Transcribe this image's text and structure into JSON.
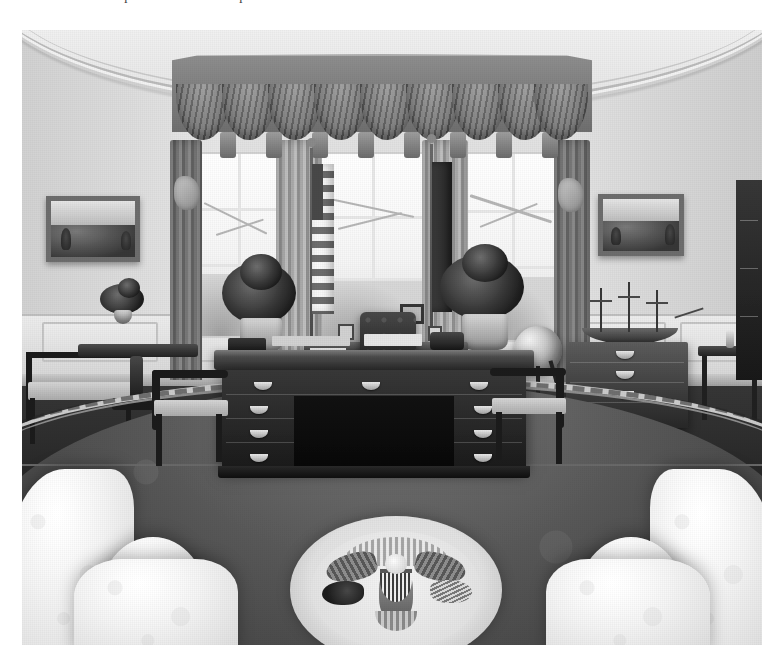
{
  "page": {
    "background_color": "#ffffff",
    "text_remnants": [
      "l",
      "l"
    ]
  },
  "photograph": {
    "title": "The Oval Office",
    "description": "Black and white photograph of the White House Oval Office",
    "style": "black-and-white halftone print",
    "frame": {
      "x": 22,
      "y": 30,
      "width": 740,
      "height": 615
    },
    "colors": {
      "wall": "#d8d8d8",
      "ceiling_cornice": "#efefef",
      "drapery": "#8f8f8f",
      "carpet": "#4f4f4f",
      "carpet_border": "#c8c8c8",
      "furniture_dark": "#2a2a2a",
      "sofa": "#f2f2f2",
      "seal": "#e0e0e0"
    },
    "elements": {
      "ceiling": "curved-cornice-molding",
      "back_wall": "oval-curved-wall",
      "wainscot": "paneled-chair-rail-wainscot",
      "window_bay": {
        "label": "three-window-bay",
        "window_count": 3,
        "valance": "swagged-pelmet-valance",
        "swag_count": 9,
        "drapery_panels": 4
      },
      "flags": [
        {
          "name": "american-flag",
          "position": "left-of-desk"
        },
        {
          "name": "presidential-flag",
          "position": "right-of-desk"
        }
      ],
      "desk": {
        "label": "resolute-desk",
        "drawer_pulls": 11,
        "items": [
          "papers",
          "telephone",
          "desk-accessories",
          "pen-set"
        ]
      },
      "desk_chair": "tufted-leather-executive-chair",
      "visitor_chairs": 2,
      "credenza": "window-credenza-with-photo-frames",
      "globe": "floor-standing-globe",
      "paintings": [
        {
          "name": "painting-left-wall",
          "subject": "landscape"
        },
        {
          "name": "painting-right-wall",
          "subject": "landscape"
        }
      ],
      "ship_model": "model-sailing-ship-on-chest",
      "chest_of_drawers": "mahogany-chest-of-drawers",
      "console_table_left": "console-table-with-flower-arrangement",
      "console_table_right": "side-console-table",
      "side_chair_left": "armchair-left-wall",
      "plants": 2,
      "carpet": "oval-carpet-with-presidential-seal",
      "presidential_seal": {
        "label": "presidential-seal",
        "components": [
          "eagle",
          "shield",
          "olive-branch",
          "arrows",
          "glory-of-stars",
          "star-ring"
        ]
      },
      "sofas": [
        {
          "name": "sofa-foreground-left"
        },
        {
          "name": "sofa-foreground-right"
        }
      ]
    }
  }
}
